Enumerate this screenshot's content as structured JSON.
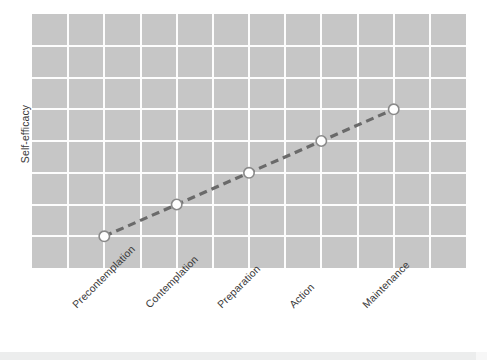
{
  "chart_data": {
    "type": "line",
    "title": "",
    "subtitle": "",
    "xlabel": "",
    "ylabel": "Self-efficacy",
    "categories": [
      "Precontemplation",
      "Contemplation",
      "Preparation",
      "Action",
      "Maintenance"
    ],
    "series": [
      {
        "name": "Self-efficacy",
        "values": [
          1,
          2,
          3,
          4,
          5
        ],
        "line_style": "dashed",
        "line_color": "#6a6a6a",
        "marker": "circle",
        "marker_face_color": "#ffffff",
        "marker_edge_color": "#8a8a8a"
      }
    ],
    "ylim": [
      0,
      8
    ],
    "yticks_visible": false,
    "ytick_labels": [],
    "xtick_rotation": -45,
    "grid": true,
    "grid_color": "#fdfdfd",
    "plot_background": "#c6c6c6",
    "figure_background": "#ffffff",
    "legend": "none",
    "legend_position": "none",
    "vertical_gridline_count": 11,
    "horizontal_gridline_count": 7,
    "annotations": []
  },
  "axes": {
    "y_title": "Self-efficacy",
    "x_tick_labels": [
      "Precontemplation",
      "Contemplation",
      "Preparation",
      "Action",
      "Maintenance"
    ]
  },
  "colors": {
    "plot_background": "#c6c6c6",
    "gridline": "#fdfdfd",
    "line": "#6a6a6a",
    "marker_fill": "#ffffff",
    "marker_edge": "#8a8a8a",
    "text": "#3a3a3a",
    "page_background": "#ffffff",
    "scan_strip": "#eceded"
  }
}
